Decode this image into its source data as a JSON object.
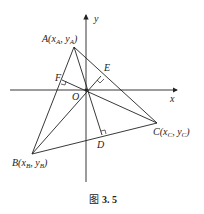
{
  "labels": {
    "A": "A(x",
    "A_sub1": "A",
    "A_mid": ", y",
    "A_sub2": "A",
    "A_end": ")",
    "B": "B(x",
    "B_sub1": "B",
    "B_mid": ", y",
    "B_sub2": "B",
    "B_end": ")",
    "C": "C(x",
    "C_sub1": "C",
    "C_mid": ", y",
    "C_sub2": "C",
    "C_end": ")",
    "D": "D",
    "E": "E",
    "F": "F",
    "O": "O",
    "x_axis": "x",
    "y_axis": "y"
  },
  "caption": {
    "prefix": "图",
    "number": "3. 5"
  }
}
